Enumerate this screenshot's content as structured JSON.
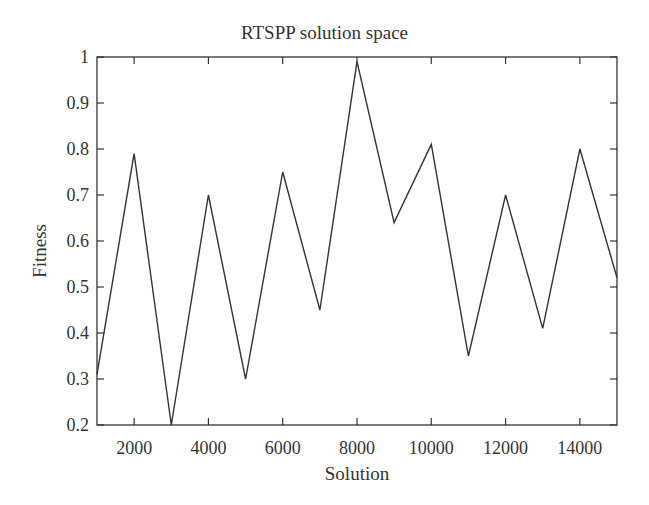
{
  "chart_data": {
    "type": "line",
    "title": "RTSPP solution space",
    "xlabel": "Solution",
    "ylabel": "Fitness",
    "xlim": [
      1000,
      15000
    ],
    "ylim": [
      0.2,
      1.0
    ],
    "x_ticks": [
      2000,
      4000,
      6000,
      8000,
      10000,
      12000,
      14000
    ],
    "x_tick_labels": [
      "2000",
      "4000",
      "6000",
      "8000",
      "10000",
      "12000",
      "14000"
    ],
    "y_ticks": [
      0.2,
      0.3,
      0.4,
      0.5,
      0.6,
      0.7,
      0.8,
      0.9,
      1.0
    ],
    "y_tick_labels": [
      "0.2",
      "0.3",
      "0.4",
      "0.5",
      "0.6",
      "0.7",
      "0.8",
      "0.9",
      "1"
    ],
    "grid": false,
    "legend": null,
    "line_color": "#333333",
    "series": [
      {
        "name": "Fitness",
        "x": [
          1000,
          2000,
          3000,
          4000,
          5000,
          6000,
          7000,
          8000,
          9000,
          10000,
          11000,
          12000,
          13000,
          14000,
          15000
        ],
        "values": [
          0.31,
          0.79,
          0.2,
          0.7,
          0.3,
          0.75,
          0.45,
          0.99,
          0.64,
          0.81,
          0.35,
          0.7,
          0.41,
          0.8,
          0.52
        ]
      }
    ]
  }
}
